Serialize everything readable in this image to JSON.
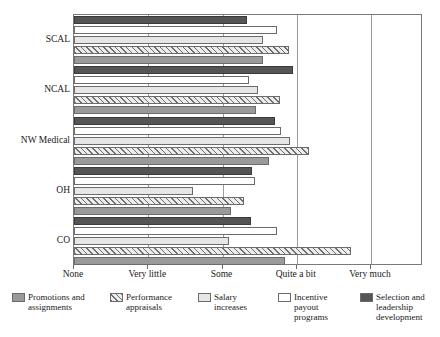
{
  "chart_data": {
    "type": "bar",
    "orientation": "horizontal",
    "title": "",
    "xlabel": "",
    "ylabel": "",
    "grid": true,
    "legend_position": "bottom",
    "categories": [
      "SCAL",
      "NCAL",
      "NW Medical",
      "OH",
      "CO"
    ],
    "x_tick_labels": [
      "None",
      "Very little",
      "Some",
      "Quite a bit",
      "Very much"
    ],
    "x_tick_values": [
      0,
      1,
      2,
      3,
      4
    ],
    "xlim": [
      0,
      4.7
    ],
    "series": [
      {
        "name": "Promotions and assignments",
        "swatch": "promotions",
        "color": "#9a9a9a",
        "values": [
          2.55,
          2.45,
          2.63,
          2.12,
          2.84
        ]
      },
      {
        "name": "Performance appraisals",
        "swatch": "appraisals",
        "color": "#ececec",
        "values": [
          2.89,
          2.77,
          3.16,
          2.29,
          3.73
        ]
      },
      {
        "name": "Salary increases",
        "swatch": "salary",
        "color": "#e6e6e6",
        "values": [
          2.55,
          2.48,
          2.91,
          1.6,
          2.09
        ]
      },
      {
        "name": "Incentive payout programs",
        "swatch": "incentive",
        "color": "#ffffff",
        "values": [
          2.74,
          2.36,
          2.79,
          2.44,
          2.73
        ]
      },
      {
        "name": "Selection and leadership development",
        "swatch": "selection",
        "color": "#555555",
        "values": [
          2.33,
          2.95,
          2.71,
          2.4,
          2.39
        ]
      }
    ]
  },
  "axes": {
    "y_labels": [
      "SCAL",
      "NCAL",
      "NW Medical",
      "OH",
      "CO"
    ],
    "x_labels": [
      "None",
      "Very little",
      "Some",
      "Quite a bit",
      "Very much"
    ]
  },
  "legend": {
    "items": [
      {
        "label": "Promotions and\nassignments",
        "swatch": "promotions"
      },
      {
        "label": "Performance\nappraisals",
        "swatch": "appraisals"
      },
      {
        "label": "Salary\nincreases",
        "swatch": "salary"
      },
      {
        "label": "Incentive\npayout\nprograms",
        "swatch": "incentive"
      },
      {
        "label": "Selection and\nleadership\ndevelopment",
        "swatch": "selection"
      }
    ]
  }
}
